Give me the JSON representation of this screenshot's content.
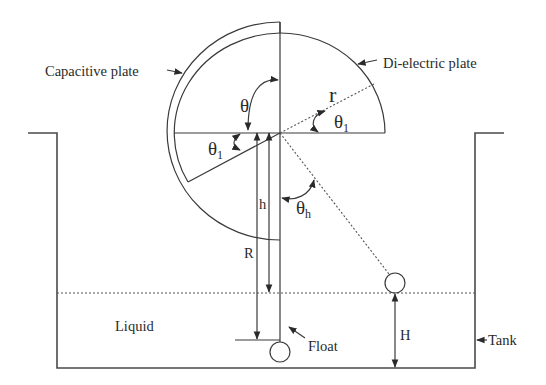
{
  "diagram": {
    "labels": {
      "capacitive_plate": "Capacitive plate",
      "dielectric_plate": "Di-electric plate",
      "liquid": "Liquid",
      "float": "Float",
      "tank": "Tank"
    },
    "symbols": {
      "theta": "θ",
      "theta1_main": "θ",
      "theta1_sub": "1",
      "theta1b_main": "θ",
      "theta1b_sub": "1",
      "thetah_main": "θ",
      "thetah_sub": "h",
      "r": "r",
      "h": "h",
      "R": "R",
      "H": "H"
    }
  }
}
